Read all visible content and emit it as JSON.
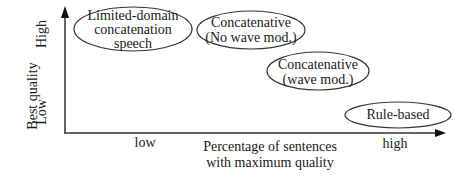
{
  "diagram": {
    "y_axis": {
      "title": "Best quality",
      "high_label": "High",
      "low_label": "Low"
    },
    "x_axis": {
      "title_line1": "Percentage of sentences",
      "title_line2": "with maximum quality",
      "low_label": "low",
      "high_label": "high"
    },
    "nodes": [
      {
        "id": "limited-domain",
        "line1": "Limited-domain",
        "line2": "concatenation",
        "line3": "speech"
      },
      {
        "id": "concat-no-wave",
        "line1": "Concatenative",
        "line2": "(No wave mod.)"
      },
      {
        "id": "concat-wave",
        "line1": "Concatenative",
        "line2": "(wave mod.)"
      },
      {
        "id": "rule-based",
        "line1": "Rule-based"
      }
    ]
  }
}
